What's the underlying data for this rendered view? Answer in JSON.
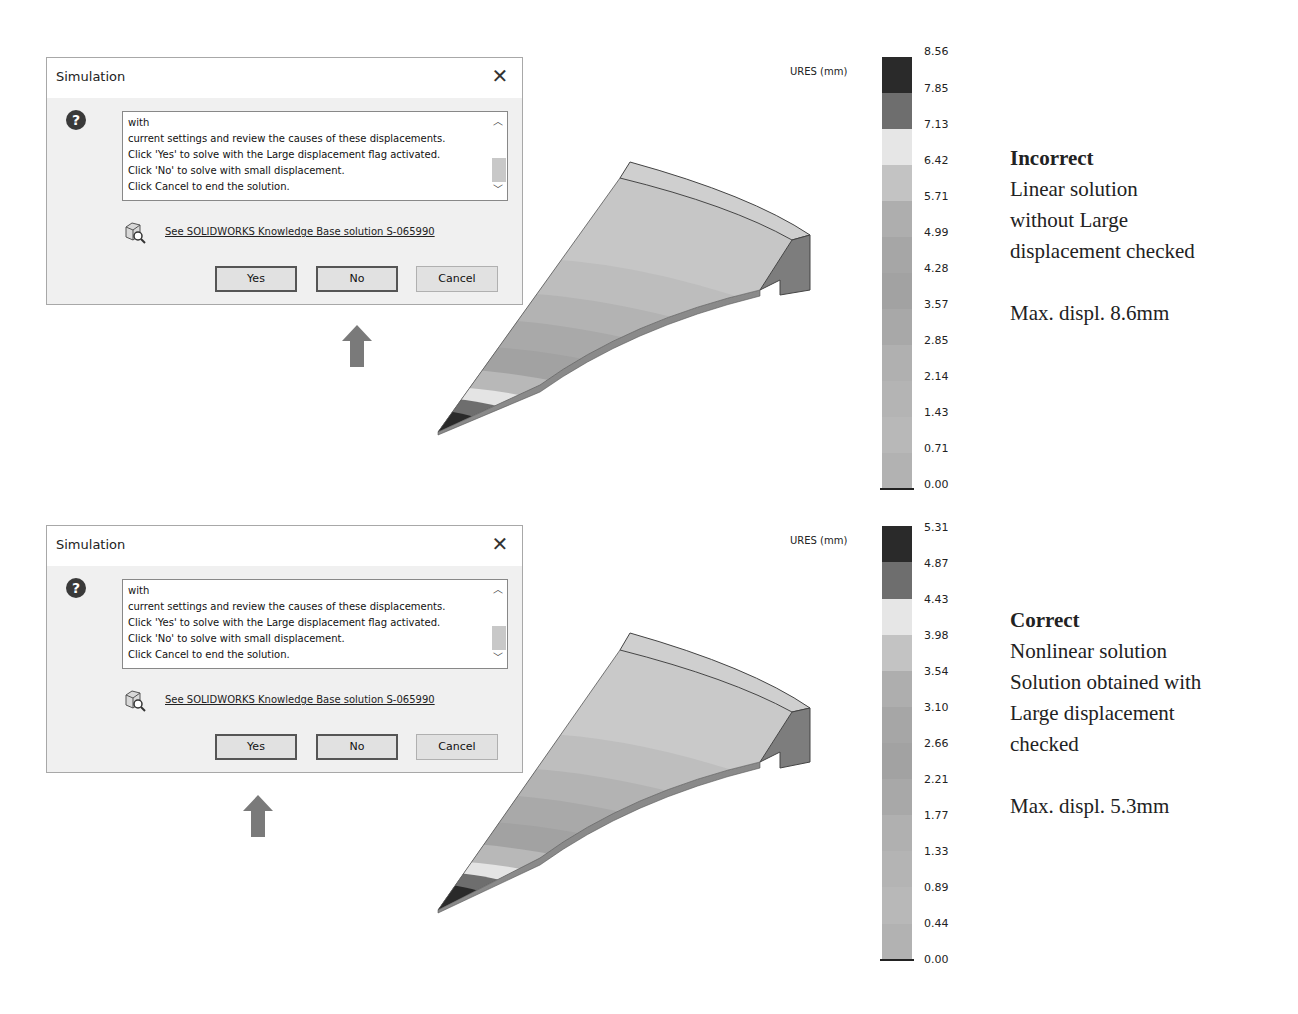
{
  "panels": [
    {
      "id": "incorrect",
      "dialog": {
        "title": "Simulation",
        "close_icon": "close-icon",
        "question_icon": "question-icon",
        "message_lines": [
          "with",
          "current settings and review the causes of these displacements.",
          "Click 'Yes' to solve with the Large displacement flag activated.",
          "Click 'No' to solve with small displacement.",
          "Click Cancel to end the solution."
        ],
        "kb_link": "See SOLIDWORKS Knowledge Base solution S-065990",
        "buttons": {
          "yes": "Yes",
          "no": "No",
          "cancel": "Cancel"
        },
        "highlighted_button": "No"
      },
      "legend": {
        "title": "URES (mm)",
        "ticks": [
          "8.56",
          "7.85",
          "7.13",
          "6.42",
          "5.71",
          "4.99",
          "4.28",
          "3.57",
          "2.85",
          "2.14",
          "1.43",
          "0.71",
          "0.00"
        ]
      },
      "caption": {
        "heading": "Incorrect",
        "lines": [
          "Linear solution",
          "without Large",
          "displacement checked"
        ],
        "max": "Max. displ. 8.6mm"
      }
    },
    {
      "id": "correct",
      "dialog": {
        "title": "Simulation",
        "close_icon": "close-icon",
        "question_icon": "question-icon",
        "message_lines": [
          "with",
          "current settings and review the causes of these displacements.",
          "Click 'Yes' to solve with the Large displacement flag activated.",
          "Click 'No' to solve with small displacement.",
          "Click Cancel to end the solution."
        ],
        "kb_link": "See SOLIDWORKS Knowledge Base solution S-065990",
        "buttons": {
          "yes": "Yes",
          "no": "No",
          "cancel": "Cancel"
        },
        "highlighted_button": "Yes"
      },
      "legend": {
        "title": "URES (mm)",
        "ticks": [
          "5.31",
          "4.87",
          "4.43",
          "3.98",
          "3.54",
          "3.10",
          "2.66",
          "2.21",
          "1.77",
          "1.33",
          "0.89",
          "0.44",
          "0.00"
        ]
      },
      "caption": {
        "heading": "Correct",
        "lines": [
          "Nonlinear solution",
          "Solution obtained with",
          "Large displacement",
          "checked"
        ],
        "max": "Max. displ. 5.3mm"
      }
    }
  ],
  "colors": {
    "legend_segments": [
      "#2a2a2a",
      "#6e6e6e",
      "#e6e6e6",
      "#c3c3c3",
      "#aeaeae",
      "#a6a6a6",
      "#a2a2a2",
      "#a8a8a8",
      "#b0b0b0",
      "#b4b4b4",
      "#b8b8b8",
      "#b2b2b2"
    ],
    "arrow": "#7a7a7a",
    "dialog_bg": "#f0f0f0"
  }
}
